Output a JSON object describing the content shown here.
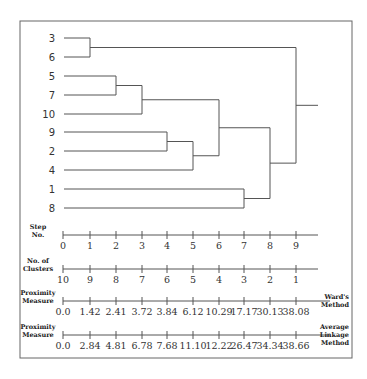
{
  "chart_data": {
    "type": "dendrogram",
    "title": "",
    "leaves": [
      "3",
      "6",
      "5",
      "7",
      "10",
      "9",
      "2",
      "4",
      "1",
      "8"
    ],
    "merges": [
      {
        "step": 1,
        "left": "3",
        "right": "6",
        "clusters_after": 9,
        "wards": 1.42,
        "average_linkage": 2.84
      },
      {
        "step": 2,
        "left": "5",
        "right": "7",
        "clusters_after": 8,
        "wards": 2.41,
        "average_linkage": 4.81
      },
      {
        "step": 3,
        "left": "(5,7)",
        "right": "10",
        "clusters_after": 7,
        "wards": 3.72,
        "average_linkage": 6.78
      },
      {
        "step": 4,
        "left": "9",
        "right": "2",
        "clusters_after": 6,
        "wards": 3.84,
        "average_linkage": 7.68
      },
      {
        "step": 5,
        "left": "(9,2)",
        "right": "4",
        "clusters_after": 5,
        "wards": 6.12,
        "average_linkage": 11.1
      },
      {
        "step": 6,
        "left": "(5,7,10)",
        "right": "(9,2,4)",
        "clusters_after": 4,
        "wards": 10.29,
        "average_linkage": 12.22
      },
      {
        "step": 7,
        "left": "1",
        "right": "8",
        "clusters_after": 3,
        "wards": 17.17,
        "average_linkage": 26.47
      },
      {
        "step": 8,
        "left": "(5,7,10,9,2,4)",
        "right": "(1,8)",
        "clusters_after": 2,
        "wards": 30.13,
        "average_linkage": 34.34
      },
      {
        "step": 9,
        "left": "(3,6)",
        "right": "(5,7,10,9,2,4,1,8)",
        "clusters_after": 1,
        "wards": 38.08,
        "average_linkage": 38.66
      }
    ],
    "axes": [
      {
        "title": [
          "Step",
          "No."
        ],
        "ticks": [
          "0",
          "1",
          "2",
          "3",
          "4",
          "5",
          "6",
          "7",
          "8",
          "9"
        ]
      },
      {
        "title": [
          "No. of",
          "Clusters"
        ],
        "ticks": [
          "10",
          "9",
          "8",
          "7",
          "6",
          "5",
          "4",
          "3",
          "2",
          "1"
        ]
      },
      {
        "title": [
          "Proximity",
          "Measure"
        ],
        "ticks": [
          "0.0",
          "1.42",
          "2.41",
          "3.72",
          "3.84",
          "6.12",
          "10.29",
          "17.17",
          "30.13",
          "38.08"
        ],
        "method": [
          "Ward's",
          "Method"
        ]
      },
      {
        "title": [
          "Proximity",
          "Measure"
        ],
        "ticks": [
          "0.0",
          "2.84",
          "4.81",
          "6.78",
          "7.68",
          "11.10",
          "12.22",
          "26.47",
          "34.34",
          "38.66"
        ],
        "method": [
          "Average",
          "Linkage",
          "Method"
        ]
      }
    ]
  },
  "layout": {
    "frame": {
      "x": 20,
      "y": 21,
      "w": 332,
      "h": 337
    },
    "leaf_start_x": 64,
    "leaf_y": [
      38,
      57,
      76,
      95,
      114,
      132,
      151,
      170,
      189,
      208
    ],
    "step_x": [
      63,
      90,
      116,
      142,
      167,
      193,
      219,
      244,
      270,
      296
    ],
    "root_end_x": 318,
    "axis_y": [
      235,
      269,
      301,
      335
    ],
    "axis_end_x": [
      318,
      318,
      330,
      330
    ],
    "colors": {
      "line": "#555555",
      "frame": "#666666",
      "text": "#333333"
    }
  }
}
